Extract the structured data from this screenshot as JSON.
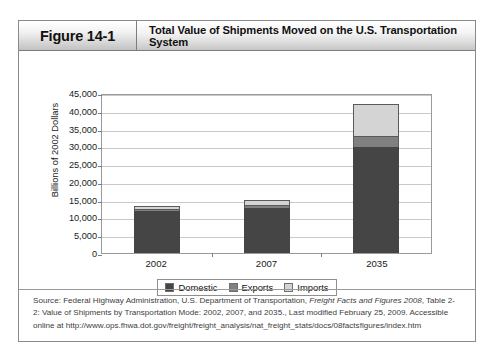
{
  "figure": {
    "tab_label": "Figure 14-1",
    "title": "Total Value of Shipments Moved on the U.S. Transportation System"
  },
  "chart_data": {
    "type": "bar",
    "subtype": "stacked-bar",
    "title": "Total Value of Shipments Moved on the U.S. Transportation System",
    "xlabel": "",
    "ylabel": "Billions of 2002 Dollars",
    "categories": [
      "2002",
      "2007",
      "2035"
    ],
    "series": [
      {
        "name": "Domestic",
        "color": "#454545",
        "values": [
          11700,
          12700,
          29800
        ]
      },
      {
        "name": "Exports",
        "color": "#808080",
        "values": [
          700,
          900,
          3200
        ]
      },
      {
        "name": "Imports",
        "color": "#d4d4d4",
        "values": [
          800,
          1300,
          9000
        ]
      }
    ],
    "totals": [
      13200,
      14900,
      42000
    ],
    "ylim": [
      0,
      45000
    ],
    "ytick_step": 5000,
    "yticks": [
      "45,000",
      "40,000",
      "35,000",
      "30,000",
      "25,000",
      "20,000",
      "15,000",
      "10,000",
      "5,000",
      "0"
    ],
    "ytick_values": [
      45000,
      40000,
      35000,
      30000,
      25000,
      20000,
      15000,
      10000,
      5000,
      0
    ],
    "grid": true,
    "legend_position": "bottom"
  },
  "legend": {
    "items": [
      {
        "label": "Domestic",
        "color": "#454545"
      },
      {
        "label": "Exports",
        "color": "#808080"
      },
      {
        "label": "Imports",
        "color": "#d4d4d4"
      }
    ]
  },
  "source": {
    "prefix": "Source: Federal Highway Administration, U.S. Department of Transportation, ",
    "italic_part": "Freight Facts and Figures 2008",
    "suffix": ", Table 2-2: Value of Shipments by Transportation Mode: 2002, 2007, and 2035., Last modified February 25, 2009. Accessible online at http://www.ops.fhwa.dot.gov/freight/freight_analysis/nat_freight_stats/docs/08factsfigures/index.htm"
  }
}
